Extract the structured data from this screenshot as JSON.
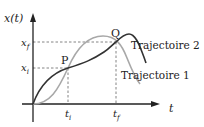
{
  "diagram": {
    "y_axis_label": "x(t)",
    "x_axis_label": "t",
    "points": [
      {
        "name": "P",
        "x_label": "t",
        "x_sub": "i",
        "y_label": "x",
        "y_sub": "i"
      },
      {
        "name": "Q",
        "x_label": "t",
        "x_sub": "f",
        "y_label": "x",
        "y_sub": "f"
      }
    ],
    "trajectories": [
      {
        "label": "Trajectoire 1",
        "color": "#a8a8a8"
      },
      {
        "label": "Trajectoire 2",
        "color": "#333333"
      }
    ],
    "axis_color": "#222222",
    "guide_color": "#666666"
  }
}
